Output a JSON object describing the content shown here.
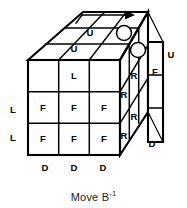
{
  "figure": {
    "caption": {
      "prefix": "Move B",
      "exponent": "-1",
      "full_text": "Move B-1"
    },
    "colors": {
      "line": "#000000",
      "background": "#ffffff",
      "text": "#1a1a1a"
    },
    "top_face": {
      "name": "up-face",
      "labels": [
        {
          "text": "U",
          "x": 88,
          "y": 33
        },
        {
          "text": "U",
          "x": 72,
          "y": 48
        }
      ],
      "markers": [
        {
          "name": "top-marker-circle-back",
          "cx": 124,
          "cy": 33,
          "r": 7.5
        },
        {
          "name": "top-marker-circle-front",
          "cx": 138,
          "cy": 49,
          "r": 7.5
        }
      ],
      "arrow": {
        "name": "rotation-arrow",
        "direction": "right",
        "x1": 82,
        "x2": 134,
        "y": 15
      }
    },
    "front_face": {
      "name": "front-face",
      "rows": [
        [
          "",
          "L",
          ""
        ],
        [
          "F",
          "F",
          "F"
        ],
        [
          "F",
          "F",
          "F"
        ]
      ]
    },
    "right_face": {
      "name": "right-face",
      "labels": [
        {
          "text": "R",
          "x": 139,
          "y": 75
        },
        {
          "text": "R",
          "x": 126,
          "y": 94
        },
        {
          "text": "R",
          "x": 139,
          "y": 117
        },
        {
          "text": "R",
          "x": 126,
          "y": 136
        }
      ]
    },
    "detached_slice": {
      "name": "back-slice-strip",
      "labels": [
        {
          "text": "U",
          "x": 172,
          "y": 55
        },
        {
          "text": "F",
          "x": 157,
          "y": 71
        },
        {
          "text": "D",
          "x": 152,
          "y": 143
        }
      ]
    },
    "left_labels": [
      {
        "text": "L",
        "x": 12,
        "y": 112
      },
      {
        "text": "L",
        "x": 12,
        "y": 138
      }
    ],
    "bottom_labels": [
      {
        "text": "D",
        "x": 45,
        "y": 167
      },
      {
        "text": "D",
        "x": 74,
        "y": 167
      },
      {
        "text": "D",
        "x": 103,
        "y": 167
      }
    ]
  }
}
